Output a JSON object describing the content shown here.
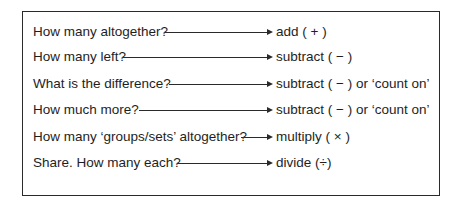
{
  "diagram": {
    "rows": [
      {
        "question": "How many altogether?",
        "operation": "add ( + )",
        "arrow_start": 165
      },
      {
        "question": "How many left?",
        "operation": "subtract ( − )",
        "arrow_start": 123
      },
      {
        "question": "What is the difference?",
        "operation": "subtract ( − ) or ‘count on’",
        "arrow_start": 169
      },
      {
        "question": "How much more?",
        "operation": "subtract ( − ) or ‘count on’",
        "arrow_start": 139
      },
      {
        "question": "How many ‘groups/sets’ altogether?",
        "operation": "multiply ( × )",
        "arrow_start": 241
      },
      {
        "question": "Share. How many each?",
        "operation": "divide (÷)",
        "arrow_start": 177
      }
    ],
    "arrow_end": 273,
    "row_tops": [
      22,
      47,
      74,
      100,
      127,
      153
    ]
  }
}
